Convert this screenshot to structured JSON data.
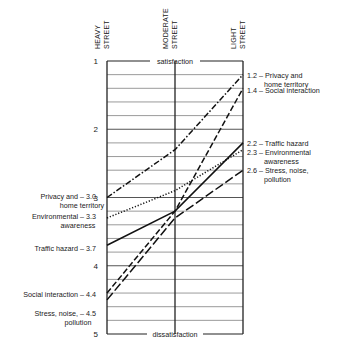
{
  "chart_data": {
    "type": "line",
    "title": "",
    "categories": [
      "HEAVY STREET",
      "MODERATE STREET",
      "LIGHT STREET"
    ],
    "category_labels": [
      [
        "HEAVY",
        "STREET"
      ],
      [
        "MODERATE",
        "STREET"
      ],
      [
        "LIGHT",
        "STREET"
      ]
    ],
    "ylabel_top": "satisfaction",
    "ylabel_bottom": "dissatisfaction",
    "ylim": [
      1,
      5
    ],
    "y_inverted": true,
    "yticks": [
      "1",
      "2",
      "3",
      "4",
      "5"
    ],
    "grid_step": 0.2,
    "series": [
      {
        "name": "Privacy and home territory",
        "style": "dash-dot",
        "values": [
          3.0,
          2.3,
          1.2
        ],
        "left_label": [
          "Privacy and – 3.0",
          "home territory"
        ],
        "right_label": [
          "1.2 – Privacy and",
          "home territory"
        ]
      },
      {
        "name": "Social interaction",
        "style": "dashed",
        "values": [
          4.4,
          3.2,
          1.4
        ],
        "left_label": [
          "Social interaction – 4.4"
        ],
        "right_label": [
          "1.4 – Social interaction"
        ]
      },
      {
        "name": "Traffic hazard",
        "style": "solid",
        "values": [
          3.7,
          3.2,
          2.2
        ],
        "left_label": [
          "Traffic hazard – 3.7"
        ],
        "right_label": [
          "2.2 – Traffic hazard"
        ]
      },
      {
        "name": "Environmental awareness",
        "style": "dotted",
        "values": [
          3.3,
          2.9,
          2.3
        ],
        "left_label": [
          "Environmental – 3.3",
          "awareness"
        ],
        "right_label": [
          "2.3 – Environmental",
          "awareness"
        ]
      },
      {
        "name": "Stress, noise, pollution",
        "style": "long-dash",
        "values": [
          4.5,
          3.3,
          2.6
        ],
        "left_label": [
          "Stress, noise, – 4.5",
          "pollution"
        ],
        "right_label": [
          "2.6 – Stress, noise,",
          "pollution"
        ]
      }
    ],
    "grid": true,
    "legend_position": "inline-labels"
  }
}
